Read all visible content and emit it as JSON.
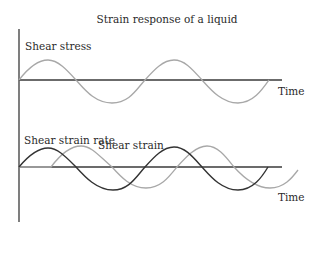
{
  "title": "Strain response of a liquid",
  "top_panel": {
    "series_label": "Shear stress",
    "axis_label": "Time",
    "curve_color": "#a8a8a8"
  },
  "bottom_panel": {
    "series_labels": [
      "Shear strain rate",
      "Shear strain"
    ],
    "axis_label": "Time",
    "strain_rate_color": "#333333",
    "strain_color": "#a8a8a8"
  },
  "axis_color": "#3a3a3a"
}
